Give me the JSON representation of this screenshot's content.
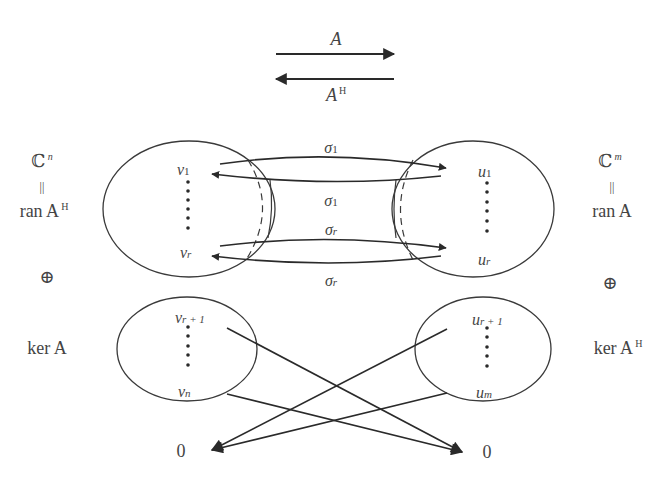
{
  "legend": {
    "forward_label": "A",
    "backward_label": "A",
    "backward_sup": "H"
  },
  "left_space": {
    "domain": "ℂ",
    "domain_sup": "n",
    "equals": "||",
    "range_label": "ran A",
    "range_sup": "H",
    "direct_sum": "⊕",
    "kernel_label": "ker A"
  },
  "right_space": {
    "domain": "ℂ",
    "domain_sup": "m",
    "equals": "||",
    "range_label": "ran A",
    "direct_sum": "⊕",
    "kernel_label": "ker A",
    "kernel_sup": "H"
  },
  "left_top_ellipse": {
    "top_vector": "v",
    "top_sub": "1",
    "bottom_vector": "v",
    "bottom_sub": "r"
  },
  "right_top_ellipse": {
    "top_vector": "u",
    "top_sub": "1",
    "bottom_vector": "u",
    "bottom_sub": "r"
  },
  "left_bottom_ellipse": {
    "top_vector": "v",
    "top_sub": "r + 1",
    "bottom_vector": "v",
    "bottom_sub": "n"
  },
  "right_bottom_ellipse": {
    "top_vector": "u",
    "top_sub": "r + 1",
    "bottom_vector": "u",
    "bottom_sub": "m"
  },
  "singular_values": {
    "s1_top": "σ",
    "s1_top_sub": "1",
    "s1_bottom": "σ",
    "s1_bottom_sub": "1",
    "sr_top": "σ",
    "sr_top_sub": "r",
    "sr_bottom": "σ",
    "sr_bottom_sub": "r"
  },
  "zeros": {
    "left": "0",
    "right": "0"
  },
  "colors": {
    "stroke": "#333333",
    "text": "#444444",
    "background": "#ffffff"
  }
}
